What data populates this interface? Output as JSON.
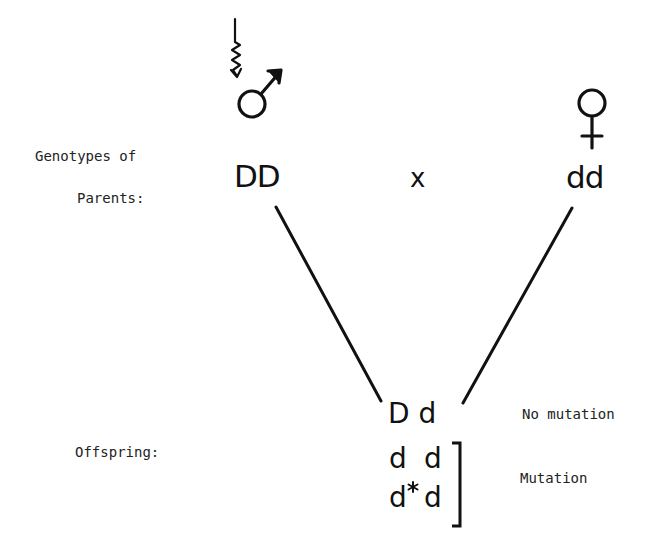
{
  "diagram": {
    "type": "genetic-cross",
    "labels": {
      "genotypes_of": "Genotypes of",
      "parents": "Parents:",
      "offspring": "Offspring:"
    },
    "parents": {
      "male": {
        "symbol": "male-symbol",
        "genotype": "DD",
        "marker": "wavy-arrow (mutagen exposure)"
      },
      "cross_sign": "x",
      "female": {
        "symbol": "female-symbol",
        "genotype": "dd"
      }
    },
    "offspring": {
      "no_mutation": {
        "genotype": "D d",
        "annotation": "No mutation"
      },
      "mutation": {
        "rows": [
          {
            "left": "d",
            "right": "d"
          },
          {
            "left": "d",
            "right": "d",
            "mark": "*"
          }
        ],
        "annotation": "Mutation"
      }
    },
    "colors": {
      "ink": "#111111",
      "background": "#ffffff"
    }
  }
}
